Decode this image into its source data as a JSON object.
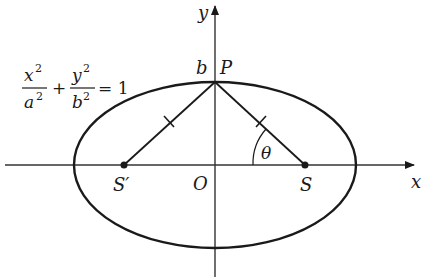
{
  "diagram": {
    "equation": {
      "x_num": "x",
      "x_sup": "2",
      "x_den": "a",
      "x_den_sup": "2",
      "plus": "+",
      "y_num": "y",
      "y_sup": "2",
      "y_den": "b",
      "y_den_sup": "2",
      "equals": "= 1"
    },
    "axes": {
      "x_label": "x",
      "y_label": "y",
      "origin_label": "O"
    },
    "points": {
      "top_label_b": "b",
      "top_label_P": "P",
      "left_focus": "S′",
      "right_focus": "S",
      "angle": "θ"
    },
    "colors": {
      "stroke": "#1a1a1a",
      "axis": "#333333",
      "background": "#ffffff"
    }
  }
}
